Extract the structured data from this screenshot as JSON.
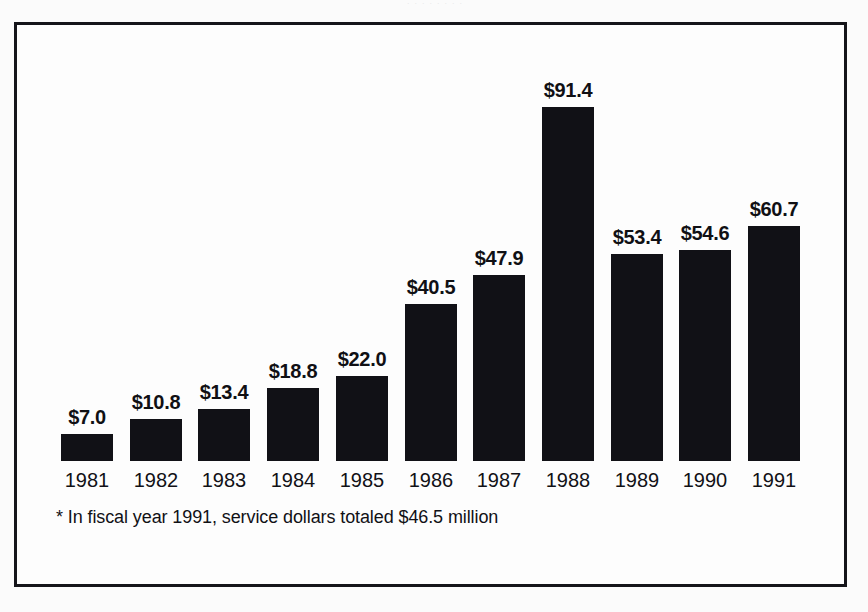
{
  "scan": {
    "top_artifact_text": "·  ·   ·    ·  ·   ·     ·  ·"
  },
  "chart_data": {
    "type": "bar",
    "title": "",
    "subtitle": "",
    "xlabel": "",
    "ylabel": "",
    "categories": [
      "1981",
      "1982",
      "1983",
      "1984",
      "1985",
      "1986",
      "1987",
      "1988",
      "1989",
      "1990",
      "1991"
    ],
    "values": [
      7.0,
      10.8,
      13.4,
      18.8,
      22.0,
      40.5,
      47.9,
      91.4,
      53.4,
      54.6,
      60.7
    ],
    "value_labels": [
      "$7.0",
      "$10.8",
      "$13.4",
      "$18.8",
      "$22.0",
      "$40.5",
      "$47.9",
      "$91.4",
      "$53.4",
      "$54.6",
      "$60.7"
    ],
    "ylim": [
      0,
      91.4
    ],
    "grid": false,
    "legend": false,
    "bar_color": "#111116",
    "frame_color": "#15151a",
    "background": "#fdfdfd"
  },
  "footnote": {
    "text": "* In fiscal year 1991, service dollars totaled $46.5 million"
  }
}
